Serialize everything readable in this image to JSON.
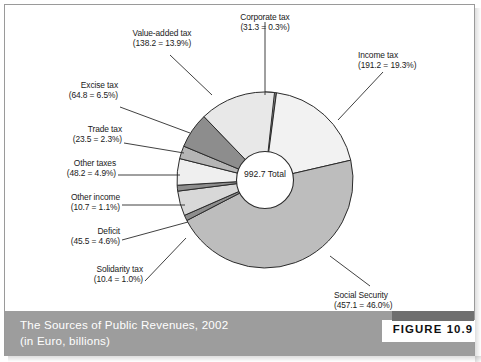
{
  "figure": {
    "number_label": "FIGURE 10.9",
    "caption_line1": "The Sources of Public Revenues, 2002",
    "caption_line2": "(in Euro, billions)",
    "caption_bg": "#9d9d9d",
    "caption_color": "#ffffff"
  },
  "center": {
    "value": "992.7",
    "label": "Total"
  },
  "labels": {
    "corporate": {
      "name": "Corporate tax",
      "detail": "(31.3 = 0.3%)"
    },
    "income": {
      "name": "Income tax",
      "detail": "(191.2 = 19.3%)"
    },
    "social": {
      "name": "Social Security",
      "detail": "(457.1 = 46.0%)"
    },
    "solidarity": {
      "name": "Solidarity tax",
      "detail": "(10.4 = 1.0%)"
    },
    "deficit": {
      "name": "Deficit",
      "detail": "(45.5 = 4.6%)"
    },
    "otherincome": {
      "name": "Other income",
      "detail": "(10.7 = 1.1%)"
    },
    "othertaxes": {
      "name": "Other taxes",
      "detail": "(48.2 = 4.9%)"
    },
    "trade": {
      "name": "Trade tax",
      "detail": "(23.5 = 2.3%)"
    },
    "excise": {
      "name": "Excise tax",
      "detail": "(64.8 = 6.5%)"
    },
    "vat": {
      "name": "Value-added tax",
      "detail": "(138.2 = 13.9%)"
    }
  },
  "chart_data": {
    "type": "pie",
    "title": "The Sources of Public Revenues, 2002",
    "subtitle": "(in Euro, billions)",
    "units": "Euro, billions",
    "total": 992.7,
    "total_label": "992.7 Total",
    "donut": true,
    "start_angle_deg": -90,
    "direction": "clockwise",
    "legend": "none (direct labels with leader lines)",
    "grid": false,
    "categories": [
      "Corporate tax",
      "Income tax",
      "Social Security",
      "Solidarity tax",
      "Deficit",
      "Other income",
      "Other taxes",
      "Trade tax",
      "Excise tax",
      "Value-added tax"
    ],
    "values": [
      31.3,
      191.2,
      457.1,
      10.4,
      45.5,
      10.7,
      48.2,
      23.5,
      64.8,
      138.2
    ],
    "percent_labels": [
      "0.3%",
      "19.3%",
      "46.0%",
      "1.0%",
      "4.6%",
      "1.1%",
      "4.9%",
      "2.3%",
      "6.5%",
      "13.9%"
    ],
    "percent_values": [
      0.3,
      19.3,
      46.0,
      1.0,
      4.6,
      1.1,
      4.9,
      2.3,
      6.5,
      13.9
    ],
    "slice_colors": [
      "#8d8d8d",
      "#f2f2f2",
      "#bdbdbd",
      "#8d8d8d",
      "#d8d8d8",
      "#8d8d8d",
      "#efefef",
      "#b5b5b5",
      "#8d8d8d",
      "#e8e8e8"
    ],
    "slice_sweeps_deg": [
      7.5,
      69.5,
      165.6,
      3.7,
      16.4,
      3.9,
      17.5,
      8.5,
      23.5,
      50.1
    ],
    "outline_color": "#2b2b2b",
    "hub_color": "#ffffff"
  }
}
